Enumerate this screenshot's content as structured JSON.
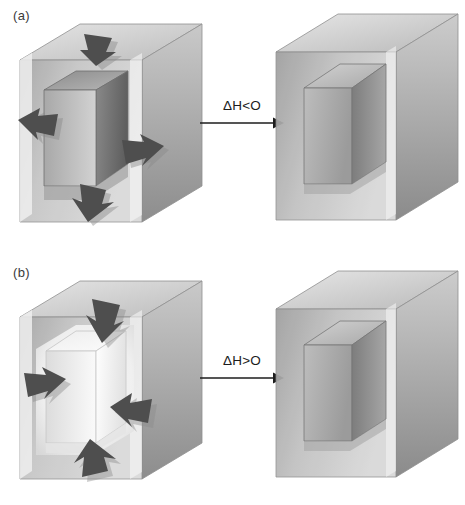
{
  "figure": {
    "background_color": "#ffffff"
  },
  "panels": [
    {
      "id": "a",
      "label": "(a)",
      "process": "exothermic",
      "reaction": {
        "delta_h_label": "ΔH<O",
        "arrow_icon": "right-arrow-icon",
        "direction": "right"
      },
      "reactant": {
        "name": "exothermic-reactant-box",
        "inner_block_shade": "dark",
        "inner_block_colors": {
          "top": "#8e8e8e",
          "left": "#9d9d9d",
          "right": "#6d6d6d"
        },
        "heat_arrows": {
          "direction": "outward",
          "count": 4,
          "positions": [
            "top",
            "left",
            "right",
            "bottom"
          ],
          "color": "#4e4e4e"
        }
      },
      "product": {
        "name": "exothermic-product-box",
        "cavity_shade": "medium",
        "heat_arrows": {
          "count": 0
        }
      }
    },
    {
      "id": "b",
      "label": "(b)",
      "process": "endothermic",
      "reaction": {
        "delta_h_label": "ΔH>O",
        "arrow_icon": "right-arrow-icon",
        "direction": "right"
      },
      "reactant": {
        "name": "endothermic-reactant-box",
        "inner_block_shade": "light",
        "inner_block_colors": {
          "top": "#f2f2f2",
          "left": "#e8e8e8",
          "right": "#fbfbfb"
        },
        "heat_arrows": {
          "direction": "inward",
          "count": 4,
          "positions": [
            "top",
            "left",
            "right",
            "bottom"
          ],
          "color": "#4e4e4e"
        }
      },
      "product": {
        "name": "endothermic-product-box",
        "cavity_shade": "medium",
        "heat_arrows": {
          "count": 0
        }
      }
    }
  ],
  "palette": {
    "shell_front": "#b9b9b9",
    "shell_top": "#d6d6d6",
    "shell_side": "#9a9a9a",
    "shell_edge": "#f4f4f4",
    "cavity_back": "#adadad",
    "cavity_left": "#8f8f8f",
    "cavity_top": "#c6c6c6",
    "arrow_fill": "#4e4e4e",
    "arrow_shadow": "#8a8a8a",
    "text": "#1c1c1c",
    "outline": "#6f6f6f"
  }
}
